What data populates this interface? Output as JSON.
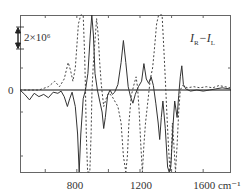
{
  "chart_data": {
    "type": "line",
    "title": "",
    "xlabel": "cm⁻¹",
    "ylabel": "",
    "x_unit": "cm⁻¹",
    "xlim": [
      440,
      1770
    ],
    "x_ticks": [
      800,
      1200,
      1600
    ],
    "x_tick_labels": [
      "800",
      "1200",
      "1600 cm⁻¹"
    ],
    "y_zero_label": "0",
    "scale_bar": {
      "label": "2×10⁶",
      "value": 2000000
    },
    "annotation": "I_R−I_L",
    "grid": false,
    "legend": null,
    "series": [
      {
        "name": "solid",
        "style": "solid",
        "points": [
          [
            440,
            0
          ],
          [
            470,
            -0.4
          ],
          [
            500,
            -0.9
          ],
          [
            530,
            -0.3
          ],
          [
            560,
            -0.6
          ],
          [
            590,
            -0.4
          ],
          [
            620,
            -0.7
          ],
          [
            650,
            -0.2
          ],
          [
            680,
            -0.3
          ],
          [
            700,
            -0.1
          ],
          [
            720,
            -0.6
          ],
          [
            740,
            -1.5
          ],
          [
            755,
            -0.8
          ],
          [
            770,
            -0.2
          ],
          [
            790,
            -1.5
          ],
          [
            805,
            -4.0
          ],
          [
            815,
            -10.5
          ],
          [
            825,
            -4.0
          ],
          [
            840,
            -0.8
          ],
          [
            855,
            0.0
          ],
          [
            870,
            1.5
          ],
          [
            885,
            5.0
          ],
          [
            895,
            7.0
          ],
          [
            905,
            5.0
          ],
          [
            915,
            1.5
          ],
          [
            930,
            0.0
          ],
          [
            945,
            -1.0
          ],
          [
            960,
            -2.0
          ],
          [
            970,
            -3.5
          ],
          [
            980,
            -2.5
          ],
          [
            995,
            -0.5
          ],
          [
            1010,
            0.0
          ],
          [
            1025,
            -0.4
          ],
          [
            1040,
            -0.2
          ],
          [
            1060,
            0.5
          ],
          [
            1080,
            2.5
          ],
          [
            1095,
            4.5
          ],
          [
            1110,
            2.5
          ],
          [
            1125,
            0.3
          ],
          [
            1140,
            -0.6
          ],
          [
            1155,
            -1.2
          ],
          [
            1170,
            -0.4
          ],
          [
            1190,
            0.3
          ],
          [
            1210,
            0.8
          ],
          [
            1225,
            2.4
          ],
          [
            1240,
            1.0
          ],
          [
            1255,
            0.6
          ],
          [
            1270,
            1.2
          ],
          [
            1285,
            0.4
          ],
          [
            1300,
            -1.2
          ],
          [
            1315,
            -3.0
          ],
          [
            1325,
            -4.5
          ],
          [
            1335,
            -2.5
          ],
          [
            1345,
            -1.0
          ],
          [
            1360,
            -3.5
          ],
          [
            1375,
            -7.0
          ],
          [
            1385,
            -11.0
          ],
          [
            1395,
            -7.0
          ],
          [
            1410,
            -3.0
          ],
          [
            1420,
            -1.0
          ],
          [
            1435,
            -2.5
          ],
          [
            1445,
            -0.5
          ],
          [
            1455,
            1.2
          ],
          [
            1465,
            2.2
          ],
          [
            1475,
            0.5
          ],
          [
            1490,
            0.1
          ],
          [
            1520,
            -0.1
          ],
          [
            1560,
            0.0
          ],
          [
            1600,
            -0.1
          ],
          [
            1640,
            0.0
          ],
          [
            1680,
            0.1
          ],
          [
            1720,
            0.2
          ],
          [
            1770,
            0.1
          ]
        ]
      },
      {
        "name": "dashed",
        "style": "dashed",
        "points": [
          [
            440,
            0
          ],
          [
            560,
            0
          ],
          [
            620,
            0.3
          ],
          [
            660,
            0.8
          ],
          [
            690,
            0.3
          ],
          [
            720,
            1.0
          ],
          [
            745,
            2.5
          ],
          [
            760,
            1.8
          ],
          [
            775,
            0.8
          ],
          [
            790,
            2.0
          ],
          [
            810,
            6.0
          ],
          [
            825,
            10.5
          ],
          [
            840,
            8.0
          ],
          [
            850,
            3.0
          ],
          [
            855,
            0.0
          ],
          [
            860,
            -4.0
          ],
          [
            868,
            -10.0
          ],
          [
            875,
            -14.0
          ],
          [
            882,
            -10.0
          ],
          [
            890,
            -4.0
          ],
          [
            896,
            0.0
          ],
          [
            905,
            2.5
          ],
          [
            915,
            4.5
          ],
          [
            925,
            6.5
          ],
          [
            935,
            5.0
          ],
          [
            945,
            2.5
          ],
          [
            955,
            0.5
          ],
          [
            970,
            -1.5
          ],
          [
            985,
            -0.8
          ],
          [
            1000,
            -0.3
          ],
          [
            1020,
            -0.5
          ],
          [
            1040,
            -1.0
          ],
          [
            1060,
            -1.5
          ],
          [
            1080,
            -3.0
          ],
          [
            1095,
            -6.0
          ],
          [
            1110,
            -8.5
          ],
          [
            1120,
            -6.0
          ],
          [
            1130,
            -3.0
          ],
          [
            1145,
            -0.5
          ],
          [
            1160,
            0.4
          ],
          [
            1175,
            1.2
          ],
          [
            1185,
            0.2
          ],
          [
            1195,
            -2.0
          ],
          [
            1205,
            -5.0
          ],
          [
            1215,
            -7.5
          ],
          [
            1225,
            -5.0
          ],
          [
            1235,
            -3.0
          ],
          [
            1250,
            -1.0
          ],
          [
            1265,
            1.0
          ],
          [
            1280,
            2.0
          ],
          [
            1290,
            3.5
          ],
          [
            1305,
            6.0
          ],
          [
            1318,
            9.0
          ],
          [
            1328,
            12.0
          ],
          [
            1340,
            9.0
          ],
          [
            1350,
            4.0
          ],
          [
            1360,
            1.0
          ],
          [
            1370,
            -2.0
          ],
          [
            1380,
            -5.0
          ],
          [
            1390,
            -9.5
          ],
          [
            1398,
            -6.0
          ],
          [
            1405,
            -3.0
          ],
          [
            1415,
            -5.0
          ],
          [
            1425,
            -7.5
          ],
          [
            1435,
            -5.0
          ],
          [
            1445,
            -2.0
          ],
          [
            1455,
            0.0
          ],
          [
            1470,
            0.4
          ],
          [
            1500,
            0.2
          ],
          [
            1540,
            0.3
          ],
          [
            1580,
            0.2
          ],
          [
            1620,
            0.3
          ],
          [
            1660,
            0.2
          ],
          [
            1700,
            0.4
          ],
          [
            1740,
            0.3
          ],
          [
            1770,
            0.2
          ]
        ]
      }
    ],
    "y_units_per_scale_bar": 2
  }
}
